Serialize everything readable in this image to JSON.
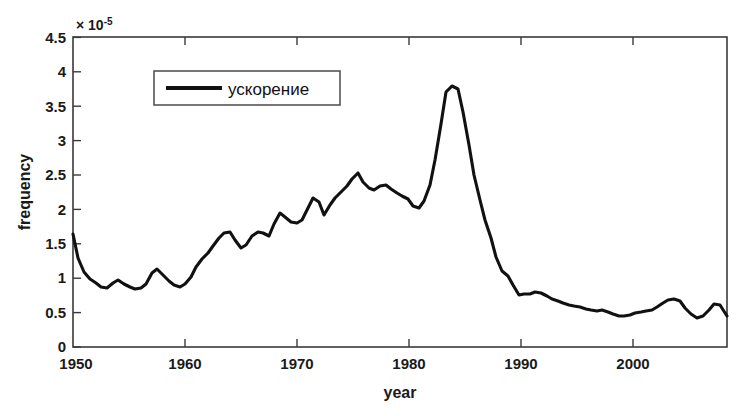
{
  "figure": {
    "background_color": "#ffffff",
    "line_color": "#111111",
    "axis_color": "#3a3a3a"
  },
  "axes": {
    "y_exponent_mantissa": "× 10",
    "y_exponent_power": "-5",
    "y_title": "frequency",
    "x_title": "year",
    "y_ticks": [
      "0",
      "0.5",
      "1",
      "1.5",
      "2",
      "2.5",
      "3",
      "3.5",
      "4",
      "4.5"
    ],
    "x_ticks": [
      "1950",
      "1960",
      "1970",
      "1980",
      "1990",
      "2000"
    ]
  },
  "legend": {
    "entries": [
      {
        "label": "ускорение",
        "color": "#111111"
      }
    ]
  },
  "chart_data": {
    "type": "line",
    "title": "",
    "subtitle": "",
    "xlabel": "year",
    "ylabel": "frequency",
    "y_scale_factor": 1e-05,
    "y_scale_label": "× 10^-5",
    "xlim": [
      1950,
      2008.5
    ],
    "ylim": [
      0,
      4.5
    ],
    "grid": false,
    "legend_position": "top-left-inside",
    "x_tick_values": [
      1950,
      1960,
      1970,
      1980,
      1990,
      2000
    ],
    "y_tick_values": [
      0,
      0.5,
      1,
      1.5,
      2,
      2.5,
      3,
      3.5,
      4,
      4.5
    ],
    "series": [
      {
        "name": "ускорение",
        "color": "#111111",
        "x": [
          1950,
          1951,
          1952,
          1953,
          1954,
          1955,
          1956,
          1957,
          1958,
          1959,
          1960,
          1961,
          1962,
          1963,
          1964,
          1965,
          1966,
          1967,
          1968,
          1969,
          1970,
          1971,
          1972,
          1973,
          1974,
          1975,
          1976,
          1977,
          1978,
          1979,
          1980,
          1981,
          1982,
          1983,
          1984,
          1985,
          1986,
          1987,
          1988,
          1989,
          1990,
          1991,
          1992,
          1993,
          1994,
          1995,
          1996,
          1997,
          1998,
          1999,
          2000,
          2001,
          2002,
          2003,
          2004,
          2005,
          2006,
          2007,
          2008
        ],
        "y": [
          1.64,
          1.3,
          1.13,
          1.1,
          1.07,
          1.16,
          1.14,
          1.08,
          1.15,
          1.27,
          1.2,
          1.15,
          1.12,
          1.22,
          1.33,
          1.42,
          1.52,
          1.65,
          1.61,
          1.49,
          1.44,
          1.58,
          1.61,
          1.55,
          1.71,
          1.92,
          1.8,
          2.14,
          1.98,
          1.84,
          2.08,
          2.16,
          2.26,
          2.45,
          2.21,
          2.2,
          2.1,
          2.14,
          2.06,
          1.96,
          1.94,
          2.46,
          3.25,
          4.22,
          4.27,
          3.55,
          2.6,
          1.9,
          1.3,
          1.22,
          0.78,
          0.8,
          0.79,
          0.72,
          0.69,
          0.65,
          0.63,
          0.6,
          0.58
        ],
        "note_x_is_index_mapped": true
      }
    ],
    "features": {
      "start_value": 1.64,
      "early_minimum": {
        "year": 1954,
        "value": 1.07
      },
      "peak": {
        "year": 1986.5,
        "value": 4.27
      },
      "post_peak_plateau": {
        "year_range": [
          1993,
          2008
        ],
        "value_range": [
          0.47,
          0.8
        ]
      },
      "end_value": 0.48
    }
  },
  "curve_points_px": [
    [
      73,
      234
    ],
    [
      78,
      258
    ],
    [
      84,
      272
    ],
    [
      90,
      279
    ],
    [
      96,
      283
    ],
    [
      101,
      287
    ],
    [
      107,
      288
    ],
    [
      113,
      283
    ],
    [
      118,
      280
    ],
    [
      124,
      284
    ],
    [
      130,
      287
    ],
    [
      135,
      289
    ],
    [
      141,
      288
    ],
    [
      146,
      284
    ],
    [
      152,
      273
    ],
    [
      157,
      269
    ],
    [
      163,
      275
    ],
    [
      169,
      281
    ],
    [
      174,
      285
    ],
    [
      180,
      287
    ],
    [
      185,
      284
    ],
    [
      191,
      277
    ],
    [
      196,
      267
    ],
    [
      202,
      259
    ],
    [
      208,
      253
    ],
    [
      213,
      246
    ],
    [
      219,
      238
    ],
    [
      224,
      233
    ],
    [
      230,
      232
    ],
    [
      235,
      240
    ],
    [
      241,
      248
    ],
    [
      246,
      245
    ],
    [
      252,
      236
    ],
    [
      258,
      232
    ],
    [
      263,
      233
    ],
    [
      269,
      236
    ],
    [
      274,
      224
    ],
    [
      280,
      213
    ],
    [
      285,
      217
    ],
    [
      291,
      222
    ],
    [
      297,
      223
    ],
    [
      302,
      220
    ],
    [
      308,
      208
    ],
    [
      313,
      198
    ],
    [
      319,
      202
    ],
    [
      324,
      215
    ],
    [
      330,
      205
    ],
    [
      335,
      198
    ],
    [
      341,
      192
    ],
    [
      347,
      186
    ],
    [
      352,
      179
    ],
    [
      358,
      173
    ],
    [
      363,
      182
    ],
    [
      369,
      188
    ],
    [
      374,
      190
    ],
    [
      380,
      186
    ],
    [
      386,
      185
    ],
    [
      391,
      189
    ],
    [
      397,
      193
    ],
    [
      402,
      196
    ],
    [
      408,
      199
    ],
    [
      413,
      206
    ],
    [
      419,
      208
    ],
    [
      424,
      201
    ],
    [
      430,
      185
    ],
    [
      435,
      160
    ],
    [
      441,
      124
    ],
    [
      446,
      92
    ],
    [
      452,
      86
    ],
    [
      458,
      89
    ],
    [
      463,
      112
    ],
    [
      469,
      145
    ],
    [
      474,
      175
    ],
    [
      480,
      200
    ],
    [
      485,
      220
    ],
    [
      491,
      238
    ],
    [
      496,
      257
    ],
    [
      502,
      271
    ],
    [
      508,
      276
    ],
    [
      513,
      285
    ],
    [
      519,
      295
    ],
    [
      524,
      294
    ],
    [
      530,
      294
    ],
    [
      535,
      292
    ],
    [
      541,
      293
    ],
    [
      547,
      296
    ],
    [
      552,
      299
    ],
    [
      558,
      301
    ],
    [
      563,
      303
    ],
    [
      569,
      305
    ],
    [
      574,
      306
    ],
    [
      580,
      307
    ],
    [
      586,
      309
    ],
    [
      591,
      310
    ],
    [
      597,
      311
    ],
    [
      602,
      310
    ],
    [
      608,
      312
    ],
    [
      613,
      314
    ],
    [
      619,
      316
    ],
    [
      624,
      316
    ],
    [
      630,
      315
    ],
    [
      635,
      313
    ],
    [
      641,
      312
    ],
    [
      646,
      311
    ],
    [
      652,
      310
    ],
    [
      657,
      307
    ],
    [
      663,
      303
    ],
    [
      668,
      300
    ],
    [
      674,
      299
    ],
    [
      680,
      301
    ],
    [
      685,
      308
    ],
    [
      691,
      314
    ],
    [
      697,
      318
    ],
    [
      703,
      316
    ],
    [
      709,
      310
    ],
    [
      714,
      304
    ],
    [
      720,
      305
    ],
    [
      727,
      316
    ]
  ]
}
